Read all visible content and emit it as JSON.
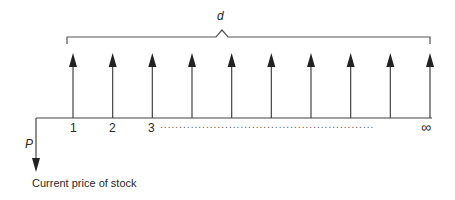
{
  "diagram": {
    "type": "cash-flow timeline",
    "bracket_label": "d",
    "initial_label": "P",
    "initial_caption": "Current price of stock",
    "periods": [
      "1",
      "2",
      "3"
    ],
    "continuation": "........................................................",
    "infinity_label": "∞",
    "arrow_count": 10,
    "line_color": "#333333"
  }
}
